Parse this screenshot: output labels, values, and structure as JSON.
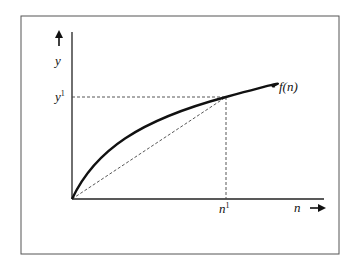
{
  "figure": {
    "type": "concave function with secant line from origin",
    "frame": true,
    "curve_label": "f(n)",
    "x_axis": {
      "label": "n",
      "arrow": "→",
      "marker_label": "n",
      "marker_sup": "1"
    },
    "y_axis": {
      "label": "y",
      "arrow": "↑",
      "marker_label": "y",
      "marker_sup": "1"
    },
    "point": {
      "x_label": "n¹",
      "y_label": "y¹"
    },
    "colors": {
      "line": "#111111",
      "frame": "#555555",
      "dashed": "#444444",
      "background": "#ffffff"
    }
  }
}
